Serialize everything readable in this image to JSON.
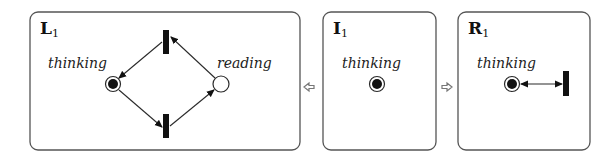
{
  "panels": {
    "left": {
      "title": "L",
      "subscript": "1",
      "places": [
        {
          "label": "thinking",
          "marked": true
        },
        {
          "label": "reading",
          "marked": false
        }
      ],
      "transitions": [
        "top",
        "bottom"
      ]
    },
    "initial": {
      "title": "I",
      "subscript": "1",
      "places": [
        {
          "label": "thinking",
          "marked": true
        }
      ]
    },
    "right": {
      "title": "R",
      "subscript": "1",
      "places": [
        {
          "label": "thinking",
          "marked": true
        }
      ],
      "transitions": [
        "read-arc-target"
      ]
    }
  },
  "connectors": {
    "to_left": "left-arrow",
    "to_right": "right-arrow"
  }
}
